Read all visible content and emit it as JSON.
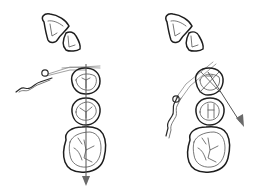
{
  "figure": {
    "type": "dental occlusal diagram",
    "panels": [
      {
        "id": "left",
        "description": "Incisor pair above; premolars and molar in occlusal view with vertical arrow through central grooves",
        "arrow_direction": "down"
      },
      {
        "id": "right",
        "description": "Incisor pair above; premolars and molar in occlusal view with diagonal arrow toward lower right",
        "arrow_direction": "down-right"
      }
    ],
    "colors": {
      "line": "#2b2b2b",
      "arrow": "#6a6a6a",
      "background": "#ffffff"
    }
  }
}
